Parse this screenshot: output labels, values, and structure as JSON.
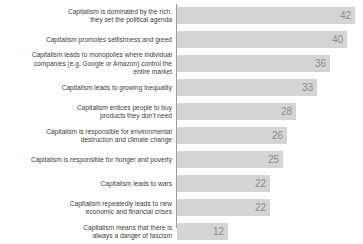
{
  "chart_data": {
    "type": "bar",
    "orientation": "horizontal",
    "title": "",
    "subtitle": "",
    "xlabel": "",
    "ylabel": "",
    "xlim": [
      0,
      42
    ],
    "grid": false,
    "legend": null,
    "value_labels_inside_bars": true,
    "categories": [
      "Capitalism is dominated by the rich,\nthey set the political agenda",
      "Capitalism promotes selfishness and greed",
      "Capitalism leads to monopolies where individual\ncompanies (e.g. Google or Amazon) control the\nentire market",
      "Capitalism leads to growing inequality",
      "Capitalism entices people to buy\nproducts they don't need",
      "Capitalism is responsible for environmental\ndestruction and climate change",
      "Capitalism is responsible for hunger and poverty",
      "Capitalism leads to wars",
      "Capitalism repeatedly leads to new\neconomic and financial crises",
      "Capitalism means that there is\nalways a danger of fascism"
    ],
    "values": [
      42,
      40,
      36,
      33,
      28,
      26,
      25,
      22,
      22,
      12
    ],
    "value_text": [
      "42",
      "40",
      "36",
      "33",
      "28",
      "26",
      "25",
      "22",
      "22",
      "12"
    ],
    "colors": {
      "bar": "#d4d4d4",
      "value_label": "#8c8c8c",
      "category_label": "#3c3c3c",
      "axis": "#9a9a9a",
      "background": "#ffffff"
    }
  }
}
